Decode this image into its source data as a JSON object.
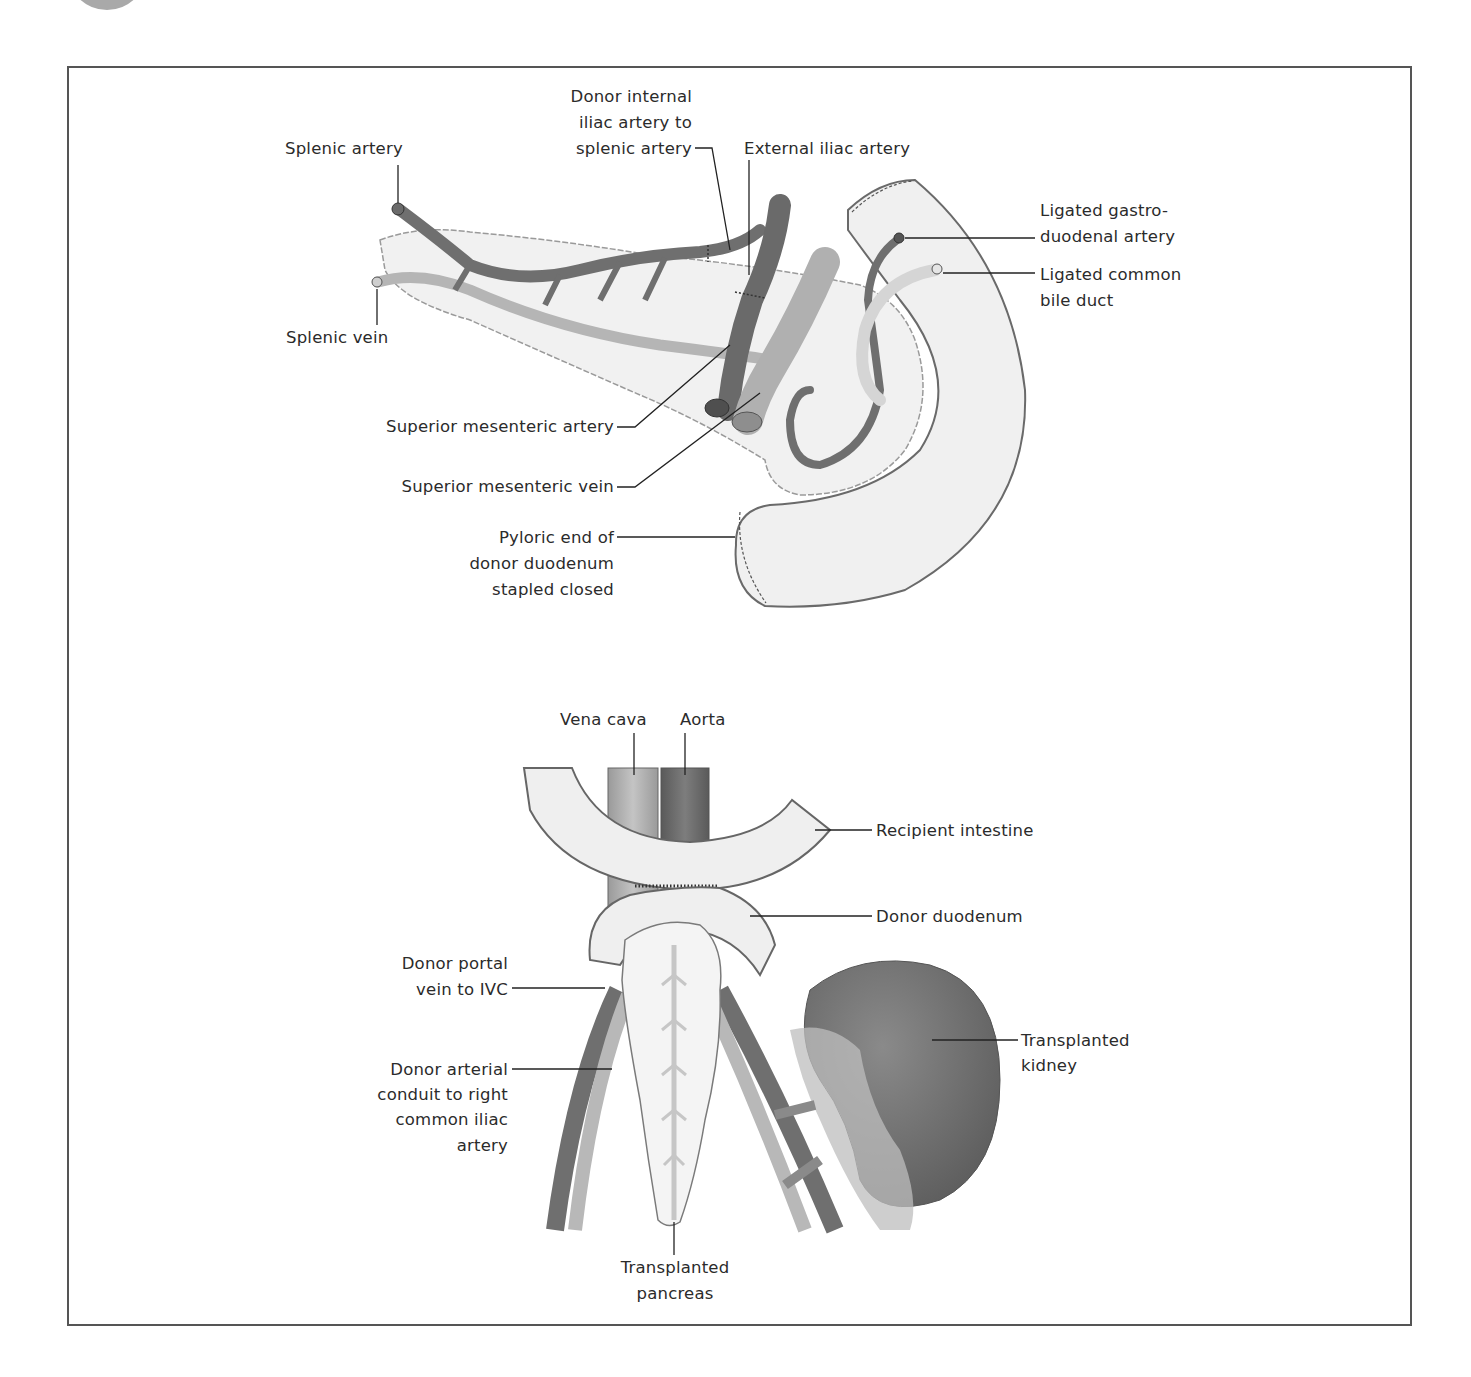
{
  "figure": {
    "panels": [
      {
        "id": "top",
        "description": "Donor pancreas with duodenal segment prepared for transplantation",
        "labels": {
          "splenic_artery": "Splenic artery",
          "donor_internal_iliac_1": "Donor internal",
          "donor_internal_iliac_2": "iliac artery to",
          "donor_internal_iliac_3": "splenic artery",
          "external_iliac_artery": "External iliac artery",
          "ligated_gastro_1": "Ligated gastro-",
          "ligated_gastro_2": "duodenal artery",
          "ligated_bile_1": "Ligated common",
          "ligated_bile_2": "bile duct",
          "splenic_vein": "Splenic vein",
          "sma": "Superior mesenteric artery",
          "smv": "Superior mesenteric vein",
          "pyloric_1": "Pyloric end of",
          "pyloric_2": "donor duodenum",
          "pyloric_3": "stapled closed"
        }
      },
      {
        "id": "bottom",
        "description": "Pancreas and kidney transplanted into recipient",
        "labels": {
          "vena_cava": "Vena cava",
          "aorta": "Aorta",
          "recipient_intestine": "Recipient intestine",
          "donor_duodenum": "Donor duodenum",
          "portal_1": "Donor portal",
          "portal_2": "vein to IVC",
          "arterial_1": "Donor arterial",
          "arterial_2": "conduit to right",
          "arterial_3": "common iliac",
          "arterial_4": "artery",
          "kidney_1": "Transplanted",
          "kidney_2": "kidney",
          "pancreas_1": "Transplanted",
          "pancreas_2": "pancreas"
        }
      }
    ],
    "colors": {
      "artery": "#6f6f6f",
      "vein": "#a8a8a8",
      "tissue": "#efefef",
      "outline": "#707070",
      "kidney": "#7a7a7a",
      "frame": "#555555"
    }
  }
}
